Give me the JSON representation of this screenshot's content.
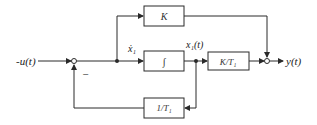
{
  "diagram": {
    "input_label": "-u(t)",
    "output_label": "y(t)",
    "minus_sign": "−",
    "signal_xdot_label": "ẋ₁",
    "signal_x_label": "x₁(t)",
    "blocks": {
      "gain_K": "K",
      "integrator": "∫",
      "gain_K_over_T1": "K/T₁",
      "feedback": "1/T₁"
    },
    "colors": {
      "line": "#2a2a2a",
      "background": "#ffffff"
    }
  }
}
